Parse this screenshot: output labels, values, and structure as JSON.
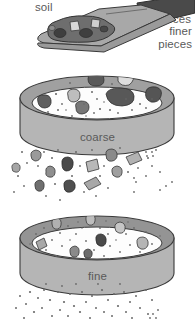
{
  "figure": {
    "labels": {
      "soil": "soil",
      "coarse": "coarse",
      "coarse_pieces_line1": "coarse",
      "coarse_pieces_line2": "pieces",
      "fine": "fine",
      "finer_pieces_line1": "finer",
      "finer_pieces_line2": "pieces"
    },
    "colors": {
      "background": "#ffffff",
      "outline": "#3a3a3a",
      "label_text": "#5a5a5a",
      "sieve_rim": "#a0a0a0",
      "sieve_rim_dark": "#8f8f8f",
      "sieve_wall": "#b5b5b5",
      "sieve_interior": "#fdfdfd",
      "trowel_blade": "#a8a8a8",
      "trowel_blade_shadow": "#8c8c8c",
      "trowel_handle": "#4a4a4a",
      "soil_mound": "#6e6e6e",
      "rock_dark": "#575757",
      "rock_mid": "#8a8a8a",
      "rock_light": "#c3c3c3",
      "speck": "#6a6a6a"
    },
    "elements": {
      "trowel": "scoop holding soil, tipped to pour",
      "sieve_top": "coarse sieve, retains large pieces",
      "sieve_bottom": "fine sieve, retains medium pieces",
      "falling_coarse": "coarse pieces falling from top sieve",
      "falling_fine": "finer pieces falling from bottom sieve"
    }
  }
}
